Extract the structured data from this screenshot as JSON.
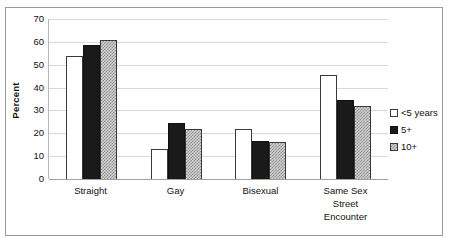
{
  "chart_data": {
    "type": "bar",
    "title": "",
    "subtitle": "",
    "xlabel": "",
    "ylabel": "Percent",
    "ylim": [
      0,
      70
    ],
    "ytick_interval": 10,
    "yticks": [
      70,
      60,
      50,
      40,
      30,
      20,
      10,
      0
    ],
    "ytick_labels": [
      "70",
      "60",
      "50",
      "40",
      "30",
      "20",
      "10",
      "0"
    ],
    "grid": true,
    "grid_axis": "y",
    "legend_position": "right",
    "categories": [
      "Straight",
      "Gay",
      "Bisexual",
      "Same Sex Street Encounter"
    ],
    "category_label_lines": [
      [
        "Straight"
      ],
      [
        "Gay"
      ],
      [
        "Bisexual"
      ],
      [
        "Same Sex",
        "Street",
        "Encounter"
      ]
    ],
    "series": [
      {
        "name": "<5 years",
        "values": [
          54,
          13,
          22,
          45.5
        ],
        "fill": "white",
        "color": "#ffffff"
      },
      {
        "name": "5+",
        "values": [
          58.5,
          24.5,
          16.5,
          34.5
        ],
        "fill": "solid-black",
        "color": "#1a1a1a"
      },
      {
        "name": "10+",
        "values": [
          61,
          22,
          16,
          32
        ],
        "fill": "checkered-gray",
        "color": "#d2d2d2"
      }
    ]
  },
  "legend": {
    "items": [
      {
        "label": "<5 years",
        "swatch": "white-square-outline"
      },
      {
        "label": "5+",
        "swatch": "black-filled-square"
      },
      {
        "label": "10+",
        "swatch": "checkered-square"
      }
    ]
  },
  "colors": {
    "series_white": "#ffffff",
    "series_black": "#1a1a1a",
    "series_pattern": "#d2d2d2",
    "bar_outline": "#3a3a3a",
    "gridline": "#d9d9d9",
    "axis": "#a0a0a0",
    "frame_border": "#9a9a9a",
    "text": "#111111",
    "background": "#ffffff"
  }
}
